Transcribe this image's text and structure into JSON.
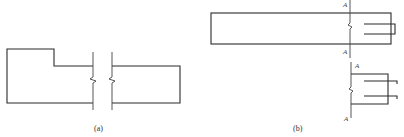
{
  "figure": {
    "panels": [
      {
        "id": "a",
        "caption": "(a)",
        "description": "Stepped beam elevation with break lines"
      },
      {
        "id": "b",
        "caption": "(b)",
        "description": "Beam end with slot, section A-A",
        "section_labels": [
          "A",
          "A",
          "A",
          "A"
        ]
      }
    ],
    "colors": {
      "line": "#2a2a2a",
      "background": "#ffffff"
    }
  }
}
